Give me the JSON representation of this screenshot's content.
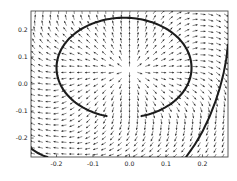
{
  "chart_data": {
    "type": "scatter",
    "plot_kind": "quiver-vector-field-with-contour",
    "title": "",
    "subtitle": "",
    "xlabel": "",
    "ylabel": "",
    "xlim": [
      -0.27,
      0.27
    ],
    "ylim": [
      -0.27,
      0.27
    ],
    "xticks": [
      -0.2,
      -0.1,
      0.0,
      0.1,
      0.2
    ],
    "xticklabels": [
      "-0.2",
      "-0.1",
      "0.0",
      "0.1",
      "0.2"
    ],
    "yticks": [
      -0.2,
      -0.1,
      0.0,
      0.1,
      0.2
    ],
    "yticklabels": [
      "-0.2",
      "-0.1",
      "0.0",
      "0.1",
      "0.2"
    ],
    "grid": false,
    "legend": null,
    "annotations": [],
    "field": {
      "description": "Dense uniform grid of small arrows radiating outward from a source near the plot centre; arrow directions rotate smoothly around the focus and align tangentially near the thick closed contour.",
      "grid_nx": 25,
      "grid_ny": 25,
      "source_x": 0.0,
      "source_y": 0.05,
      "arrow_length_px": 5.2,
      "color": "#2b2b2b"
    },
    "contours": [
      {
        "name": "main-closed-oval",
        "type": "closed-oval",
        "center_x": -0.015,
        "center_y": 0.06,
        "radius_x": 0.185,
        "radius_y": 0.185,
        "gap_start_deg": 255,
        "gap_end_deg": 285,
        "color": "#1c1c1c",
        "width_px": 2.1
      },
      {
        "name": "lower-right-arc",
        "type": "open-arc",
        "color": "#1c1c1c",
        "width_px": 2.0
      },
      {
        "name": "lower-left-corner-arc",
        "type": "open-arc",
        "color": "#1c1c1c",
        "width_px": 2.0
      }
    ],
    "colors": {
      "background": "#ffffff",
      "frame": "#4a4a4a",
      "arrows": "#2b2b2b",
      "contour": "#1c1c1c",
      "tick_text": "#1a1a1a"
    }
  },
  "figure": {
    "width": 237,
    "height": 181,
    "plot_left": 31,
    "plot_top": 11,
    "plot_right": 228,
    "plot_bottom": 157
  },
  "axes": {
    "x_tick_labels": [
      "-0.2",
      "-0.1",
      "0.0",
      "0.1",
      "0.2"
    ],
    "y_tick_labels": [
      "0.2",
      "0.1",
      "0.0",
      "-0.1",
      "-0.2"
    ]
  }
}
